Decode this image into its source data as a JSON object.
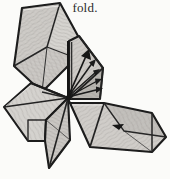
{
  "document": {
    "page_background": "#fbfbf9",
    "caption": "fold.",
    "caption_color": "#2b2b2b"
  },
  "figure": {
    "name": "origami-fold-diagram",
    "ink_color": "#1a1a1a",
    "paper_fill_light": "#d8d6d2",
    "paper_fill_mid": "#c6c3bf",
    "paper_fill_dark": "#b2afab",
    "paper_fill_shadow": "#9b9894",
    "outline_width": 2.2,
    "crease_width": 1.0,
    "flaps": [
      {
        "name": "upper-left-flap",
        "points": "22,8 60,3 78,36 76,58 42,92 14,66",
        "fill": "#d4d2ce"
      },
      {
        "name": "upper-left-flap-inner-fold",
        "points": "22,8 60,3 46,48 14,66",
        "fill": "#c9c6c2"
      },
      {
        "name": "upper-right-flap",
        "points": "68,42 78,36 103,68 100,99 69,99",
        "fill": "#cbc8c4"
      },
      {
        "name": "upper-right-flap-shadow",
        "points": "69,99 100,99 103,68",
        "fill": "#b6b3af"
      },
      {
        "name": "left-flap",
        "points": "4,107 30,84 68,98 46,120 44,141 28,141",
        "fill": "#d2d0cc"
      },
      {
        "name": "lower-left-flap",
        "points": "28,141 44,141 46,120 68,98 70,140 48,168",
        "fill": "#c8c5c1"
      },
      {
        "name": "lower-right-flap",
        "points": "70,104 104,104 152,113 166,137 152,152 90,146",
        "fill": "#cdcac6"
      },
      {
        "name": "lower-right-flap-shadow",
        "points": "104,104 152,113 166,137 120,130",
        "fill": "#bfbcb8"
      }
    ],
    "arrows": {
      "name": "fold-arrow-fan",
      "origin": [
        68,
        98
      ],
      "count": 6,
      "tips": [
        [
          88,
          52
        ],
        [
          94,
          62
        ],
        [
          97,
          70
        ],
        [
          99,
          78
        ],
        [
          100,
          86
        ]
      ]
    },
    "marks": [
      {
        "name": "small-arrowhead-mark",
        "position": [
          118,
          127
        ]
      }
    ]
  }
}
